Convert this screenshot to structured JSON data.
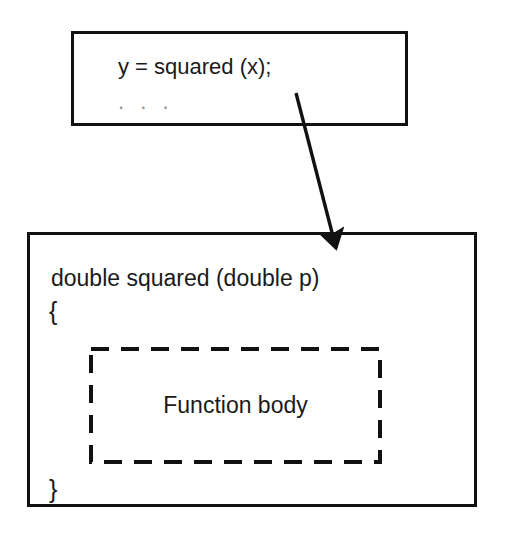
{
  "diagram": {
    "background_color": "#ffffff",
    "stroke_color": "#111111",
    "text_color": "#1a1a1a"
  },
  "caller_box": {
    "line_1": "y = squared (x);",
    "line_2": ". . .",
    "border_color": "#111111"
  },
  "function_box": {
    "signature": "double squared (double p)",
    "open_brace": "{",
    "close_brace": "}",
    "border_color": "#111111"
  },
  "body_box": {
    "label": "Function body",
    "border_style": "dashed",
    "border_color": "#111111"
  },
  "arrow": {
    "label": "call-to-definition-arrow",
    "color": "#111111",
    "from_x": 296,
    "from_y": 93,
    "to_x": 340,
    "to_y": 256
  }
}
